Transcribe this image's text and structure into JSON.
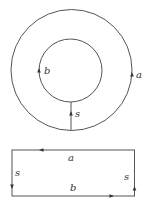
{
  "figure": {
    "annulus": {
      "outer_circle": {
        "cx": 71.5,
        "cy": 70,
        "r": 60.5,
        "label": "a",
        "arrow_direction": "up"
      },
      "inner_circle": {
        "cx": 70.5,
        "cy": 70.5,
        "r": 31.5,
        "label": "b",
        "arrow_direction": "up"
      },
      "cut_segment": {
        "label": "s",
        "arrow_direction": "up"
      }
    },
    "rectangle": {
      "top_edge": {
        "label": "a",
        "arrow_direction": "left"
      },
      "bottom_edge": {
        "label": "b",
        "arrow_direction": "right"
      },
      "left_edge": {
        "label": "s",
        "arrow_direction": "down"
      },
      "right_edge": {
        "label": "s",
        "arrow_direction": "up"
      }
    },
    "stroke_color": "#555555"
  }
}
